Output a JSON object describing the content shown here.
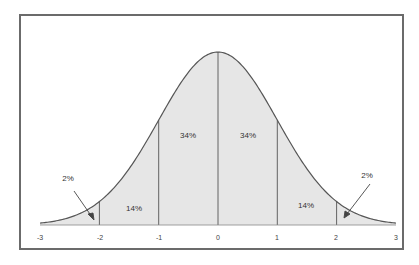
{
  "chart_data": {
    "type": "area",
    "title": "",
    "xlabel": "",
    "ylabel": "",
    "x_ticks": [
      "-3",
      "-2",
      "-1",
      "0",
      "1",
      "2",
      "3"
    ],
    "xlim": [
      -3,
      3
    ],
    "grid": false,
    "regions": [
      {
        "from": -3,
        "to": -2,
        "label": "2%",
        "annotation": "arrow"
      },
      {
        "from": -2,
        "to": -1,
        "label": "14%"
      },
      {
        "from": -1,
        "to": 0,
        "label": "34%"
      },
      {
        "from": 0,
        "to": 1,
        "label": "34%"
      },
      {
        "from": 1,
        "to": 2,
        "label": "14%"
      },
      {
        "from": 2,
        "to": 3,
        "label": "2%",
        "annotation": "arrow"
      }
    ],
    "colors": {
      "fill": "#e6e6e6",
      "line": "#555555",
      "frame": "#6b6b6b"
    }
  },
  "labels": {
    "left_tail": "2%",
    "left_mid": "14%",
    "center_left": "34%",
    "center_right": "34%",
    "right_mid": "14%",
    "right_tail": "2%"
  },
  "ticks": {
    "t0": "-3",
    "t1": "-2",
    "t2": "-1",
    "t3": "0",
    "t4": "1",
    "t5": "2",
    "t6": "3"
  }
}
